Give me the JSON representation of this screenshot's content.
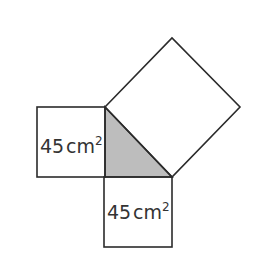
{
  "diagram": {
    "left_square": {
      "area_value": "45",
      "unit": "cm",
      "exponent": "2"
    },
    "bottom_square": {
      "area_value": "45",
      "unit": "cm",
      "exponent": "2"
    },
    "hypotenuse_square": {
      "label": ""
    },
    "colors": {
      "stroke": "#2b2b2b",
      "triangle_fill": "#b8b8b8",
      "background": "#ffffff"
    }
  }
}
